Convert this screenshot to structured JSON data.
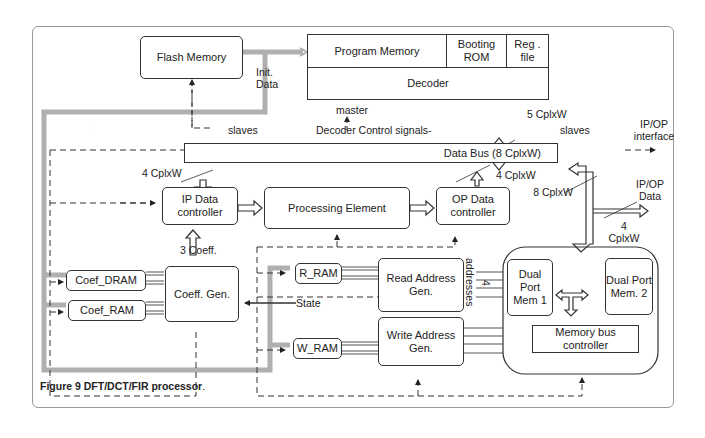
{
  "figure": {
    "caption_label": "Figure 9",
    "caption_text": " DFT/DCT/FIR processor",
    "caption_end": "."
  },
  "blocks": {
    "flash_memory": "Flash Memory",
    "program_memory": "Program Memory",
    "booting_rom": "Booting ROM",
    "reg_file": "Reg . file",
    "decoder": "Decoder",
    "data_bus": "Data Bus (8 CplxW)",
    "ip_data_controller": "IP Data controller",
    "processing_element": "Processing Element",
    "op_data_controller": "OP Data controller",
    "coef_dram": "Coef_DRAM",
    "coef_ram": "Coef_RAM",
    "coeff_gen": "Coeff. Gen.",
    "r_ram": "R_RAM",
    "w_ram": "W_RAM",
    "read_address_gen": "Read Address Gen.",
    "write_address_gen": "Write Address Gen.",
    "dual_port_mem_1": "Dual Port Mem 1",
    "dual_port_mem_2": "Dual Port Mem. 2",
    "memory_bus_controller": "Memory bus controller"
  },
  "labels": {
    "init_data": "Init. Data",
    "master": "master",
    "slaves_left": "slaves",
    "decoder_control": "Decoder  Control signals-",
    "five_cplxw": "5 CplxW",
    "slaves_right": "slaves",
    "ip_op_interface": "IP/OP interface",
    "four_cplxw_ip": "4 CplxW",
    "four_cplxw_op": "4 CplxW",
    "eight_cplxw": "8 CplxW",
    "ip_op_data": "IP/OP Data",
    "four_cplxw_data": "4 CplxW",
    "three_coeff": "3 Coeff.",
    "state": "State",
    "addresses": "addresses",
    "four": "4"
  }
}
